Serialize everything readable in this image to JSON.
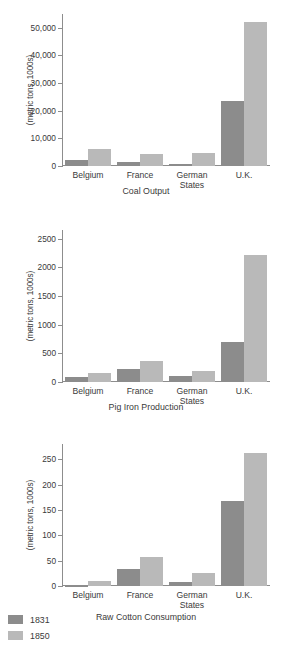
{
  "figure": {
    "ylabel": "(metric tons, 1000s)",
    "categories": [
      "Belgium",
      "France",
      "German\nStates",
      "U.K."
    ],
    "legend": {
      "items": [
        {
          "label": "1831",
          "color": "#8c8c8c"
        },
        {
          "label": "1850",
          "color": "#b9b9b9"
        }
      ]
    }
  },
  "chart_data": [
    {
      "type": "bar",
      "title": "Coal Output",
      "xlabel": "",
      "ylabel": "(metric tons, 1000s)",
      "categories": [
        "Belgium",
        "France",
        "German States",
        "U.K."
      ],
      "series": [
        {
          "name": "1831",
          "values": [
            2100,
            1400,
            700,
            23700
          ]
        },
        {
          "name": "1850",
          "values": [
            6300,
            4200,
            4700,
            52000
          ]
        }
      ],
      "ylim": [
        0,
        55000
      ],
      "yticks": [
        0,
        10000,
        20000,
        30000,
        40000,
        50000
      ],
      "ytick_labels": [
        "0",
        "10,000",
        "20,000",
        "30,000",
        "40,000",
        "50,000"
      ],
      "grid": false,
      "legend_position": "bottom-left"
    },
    {
      "type": "bar",
      "title": "Pig Iron Production",
      "xlabel": "",
      "ylabel": "(metric tons, 1000s)",
      "categories": [
        "Belgium",
        "France",
        "German States",
        "U.K."
      ],
      "series": [
        {
          "name": "1831",
          "values": [
            90,
            220,
            105,
            690
          ]
        },
        {
          "name": "1850",
          "values": [
            165,
            375,
            190,
            2210
          ]
        }
      ],
      "ylim": [
        0,
        2650
      ],
      "yticks": [
        0,
        500,
        1000,
        1500,
        2000,
        2500
      ],
      "ytick_labels": [
        "0",
        "500",
        "1000",
        "1500",
        "2000",
        "2500"
      ],
      "grid": false,
      "legend_position": "bottom-left"
    },
    {
      "type": "bar",
      "title": "Raw Cotton Consumption",
      "xlabel": "",
      "ylabel": "(metric tons, 1000s)",
      "categories": [
        "Belgium",
        "France",
        "German States",
        "U.K."
      ],
      "series": [
        {
          "name": "1831",
          "values": [
            1,
            33,
            8,
            168
          ]
        },
        {
          "name": "1850",
          "values": [
            10,
            58,
            25,
            263
          ]
        }
      ],
      "ylim": [
        0,
        280
      ],
      "yticks": [
        0,
        50,
        100,
        150,
        200,
        250
      ],
      "ytick_labels": [
        "0",
        "50",
        "100",
        "150",
        "200",
        "250"
      ],
      "grid": false,
      "legend_position": "bottom-left"
    }
  ]
}
